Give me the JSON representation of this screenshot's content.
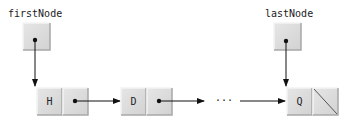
{
  "diagram": {
    "colors": {
      "cell_fill": "#dcdcdc",
      "cell_light": "#f0f0f0",
      "cell_dark": "#a8a8a8",
      "line": "#111111"
    },
    "references": [
      {
        "id": "first",
        "label": "firstNode",
        "points_to": "H"
      },
      {
        "id": "last",
        "label": "lastNode",
        "points_to": "Q"
      }
    ],
    "nodes": [
      {
        "id": "H",
        "value": "H",
        "next": "D"
      },
      {
        "id": "D",
        "value": "D",
        "next": "..."
      },
      {
        "id": "Q",
        "value": "Q",
        "next": null
      }
    ],
    "ellipsis": "···"
  }
}
